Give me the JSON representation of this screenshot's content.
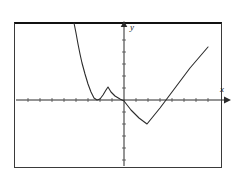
{
  "figure": {
    "frame": {
      "x": 14,
      "y": 22,
      "width": 208,
      "height": 146
    },
    "background_color": "#ffffff",
    "line_color": "#2b2b2b",
    "frame_color": "#3a3a3a"
  },
  "axes": {
    "x_axis": {
      "label": "x",
      "y_pixel": 100,
      "start_x": 16,
      "end_x": 226,
      "arrow": "right",
      "tick_spacing": 12,
      "tick_count": 17
    },
    "y_axis": {
      "label": "y",
      "x_pixel": 124,
      "start_y": 166,
      "end_y": 25,
      "arrow": "up",
      "tick_spacing": 12,
      "tick_count": 11
    },
    "origin": {
      "x": 124,
      "y": 100
    }
  },
  "chart_data": {
    "type": "line",
    "title": "",
    "xlabel": "x",
    "ylabel": "y",
    "grid": false,
    "legend": null,
    "xlim": [
      -9.2,
      8.5
    ],
    "ylim": [
      -5.5,
      6.3
    ],
    "series": [
      {
        "name": "f(x)",
        "points_pixel": [
          [
            74,
            23
          ],
          [
            76,
            33
          ],
          [
            78,
            44
          ],
          [
            80,
            54
          ],
          [
            82,
            63
          ],
          [
            85,
            74
          ],
          [
            88,
            84
          ],
          [
            91,
            92
          ],
          [
            94,
            98
          ],
          [
            97,
            100
          ],
          [
            100,
            99
          ],
          [
            103,
            95
          ],
          [
            106,
            90
          ],
          [
            108,
            87
          ],
          [
            111,
            92
          ],
          [
            115,
            96
          ],
          [
            120,
            99
          ],
          [
            124,
            101
          ],
          [
            131,
            110
          ],
          [
            139,
            118
          ],
          [
            147,
            124
          ],
          [
            160,
            108
          ],
          [
            175,
            88
          ],
          [
            190,
            68
          ],
          [
            208,
            47
          ]
        ],
        "points_data": [
          [
            -4.2,
            6.4
          ],
          [
            -4.0,
            5.6
          ],
          [
            -3.8,
            4.7
          ],
          [
            -3.7,
            3.8
          ],
          [
            -3.5,
            3.1
          ],
          [
            -3.3,
            2.2
          ],
          [
            -3.0,
            1.3
          ],
          [
            -2.8,
            0.7
          ],
          [
            -2.5,
            0.2
          ],
          [
            -2.3,
            0.0
          ],
          [
            -2.0,
            0.1
          ],
          [
            -1.8,
            0.4
          ],
          [
            -1.5,
            0.8
          ],
          [
            -1.3,
            1.1
          ],
          [
            -1.1,
            0.7
          ],
          [
            -0.8,
            0.3
          ],
          [
            -0.3,
            0.1
          ],
          [
            0.0,
            -0.1
          ],
          [
            0.6,
            -0.8
          ],
          [
            1.3,
            -1.5
          ],
          [
            1.9,
            -2.0
          ],
          [
            3.0,
            -0.7
          ],
          [
            4.3,
            0.9
          ],
          [
            5.5,
            2.7
          ],
          [
            7.0,
            4.4
          ]
        ]
      }
    ]
  }
}
